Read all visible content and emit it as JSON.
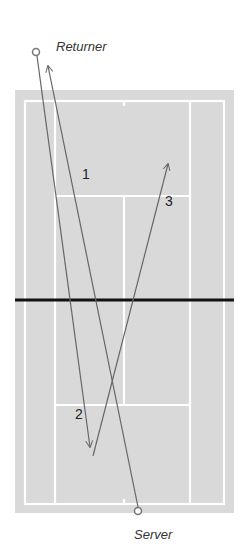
{
  "diagram": {
    "colors": {
      "court": "#d9d9d9",
      "lines": "#ffffff",
      "net": "#111111",
      "path": "#666666",
      "background": "#ffffff"
    },
    "players": {
      "returner": {
        "label": "Returner",
        "x": 36,
        "y": 52
      },
      "server": {
        "label": "Server",
        "x": 138,
        "y": 511
      }
    },
    "shots": [
      {
        "label": "1",
        "from": [
          138,
          511
        ],
        "to": [
          48,
          66
        ],
        "label_pos": [
          82,
          179
        ]
      },
      {
        "label": "2",
        "from": [
          36,
          52
        ],
        "to": [
          90,
          447
        ],
        "label_pos": [
          75,
          419
        ]
      },
      {
        "label": "3",
        "from": [
          93,
          456
        ],
        "to": [
          168,
          164
        ],
        "label_pos": [
          165,
          206
        ]
      }
    ]
  }
}
